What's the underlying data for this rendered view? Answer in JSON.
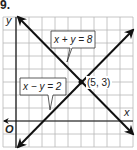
{
  "problem_number": "9.",
  "graph": {
    "axes": {
      "x_label": "x",
      "y_label": "y",
      "origin_label": "O"
    },
    "grid": {
      "x_min": -1,
      "x_max": 9,
      "y_min": -2,
      "y_max": 8,
      "step": 1
    },
    "lines": [
      {
        "equation": "x + y = 8",
        "label": "x + y = 8",
        "p1": [
          0,
          8
        ],
        "p2": [
          9,
          -1
        ]
      },
      {
        "equation": "x − y = 2",
        "label": "x − y = 2",
        "p1": [
          0,
          -2
        ],
        "p2": [
          9,
          7
        ]
      }
    ],
    "intersection": {
      "x": 5,
      "y": 3,
      "label": "(5, 3)"
    }
  },
  "colors": {
    "line": "#111111",
    "grid": "#b8b8b8",
    "label_border": "#333333"
  }
}
